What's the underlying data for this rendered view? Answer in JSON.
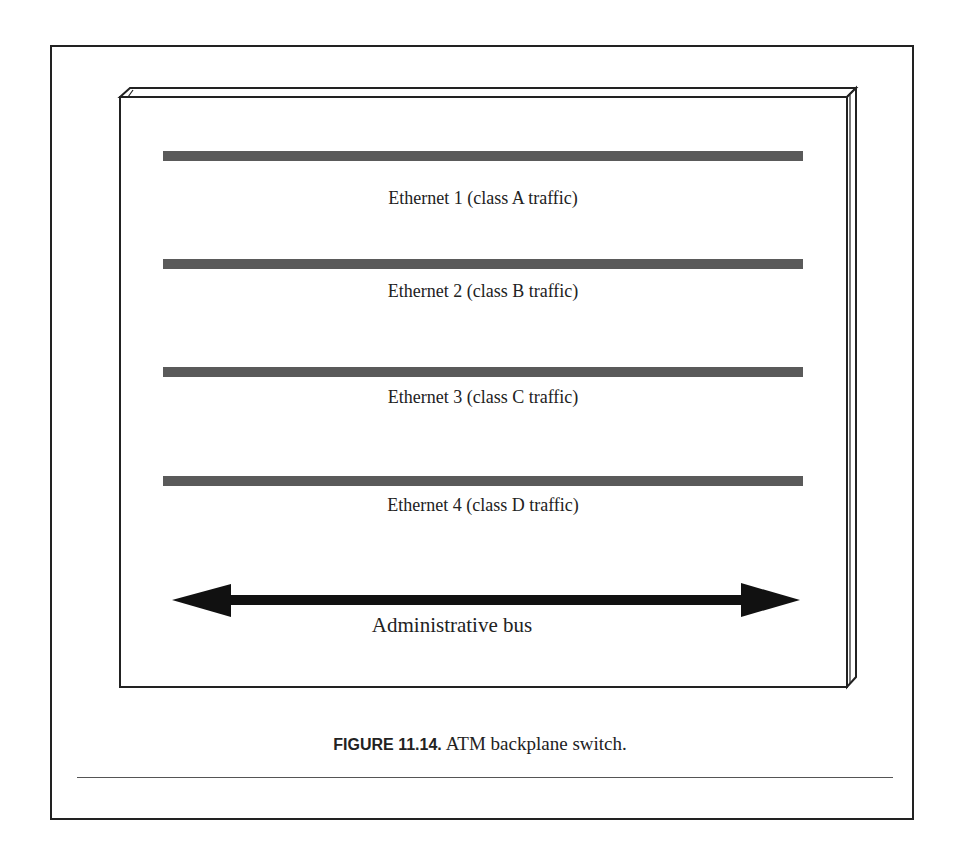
{
  "figure": {
    "number": "FIGURE 11.14.",
    "title": "ATM backplane switch."
  },
  "diagram": {
    "box": "backplane-chassis",
    "ethernets": [
      {
        "label": "Ethernet 1 (class A traffic)",
        "bar_y": 156,
        "label_y": 188
      },
      {
        "label": "Ethernet 2 (class B traffic)",
        "bar_y": 264,
        "label_y": 281
      },
      {
        "label": "Ethernet 3 (class C traffic)",
        "bar_y": 372,
        "label_y": 387
      },
      {
        "label": "Ethernet 4 (class D traffic)",
        "bar_y": 481,
        "label_y": 495
      }
    ],
    "bus": {
      "label": "Administrative bus",
      "style": "double-headed-arrow"
    },
    "colors": {
      "bar": "#5a5a5a",
      "arrow": "#111111",
      "outline": "#222222"
    }
  }
}
